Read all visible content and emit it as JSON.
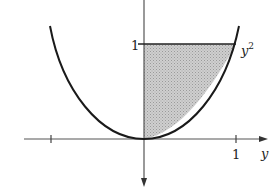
{
  "figure": {
    "curve_label": "y",
    "curve_label_exponent": "2",
    "horizontal_axis_label": "y",
    "horizontal_tick_label": "1",
    "vertical_tick_label": "1",
    "colors": {
      "line": "#1a1a1a",
      "shade": "#c4c4c4",
      "axis": "#555555",
      "background": "#ffffff"
    }
  }
}
